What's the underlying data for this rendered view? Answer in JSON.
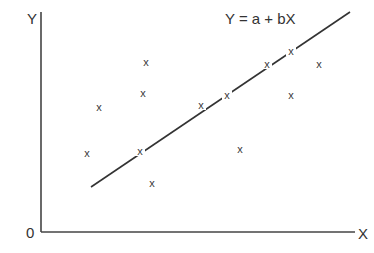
{
  "chart_data": {
    "type": "scatter",
    "title": "",
    "equation": "Y = a + bX",
    "xlabel": "X",
    "ylabel": "Y",
    "origin_label": "0",
    "grid": false,
    "legend": null,
    "marker": "x",
    "point_color": "#3a3a3a",
    "line_color": "#333333",
    "axis_color": "#444444",
    "points_px": [
      {
        "x": 146,
        "y": 62
      },
      {
        "x": 143,
        "y": 93
      },
      {
        "x": 99,
        "y": 107
      },
      {
        "x": 87,
        "y": 153
      },
      {
        "x": 140,
        "y": 151
      },
      {
        "x": 152,
        "y": 183
      },
      {
        "x": 201,
        "y": 105
      },
      {
        "x": 227,
        "y": 95
      },
      {
        "x": 240,
        "y": 149
      },
      {
        "x": 267,
        "y": 64
      },
      {
        "x": 291,
        "y": 51
      },
      {
        "x": 291,
        "y": 95
      },
      {
        "x": 319,
        "y": 64
      }
    ],
    "regression_line_px": {
      "x1": 91,
      "y1": 187,
      "x2": 350,
      "y2": 12
    },
    "axes_px": {
      "origin_x": 41,
      "origin_y": 232,
      "x_end": 355,
      "y_top": 12
    }
  }
}
